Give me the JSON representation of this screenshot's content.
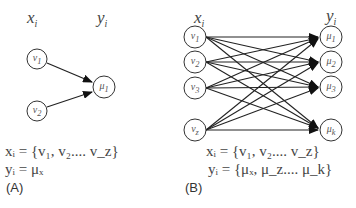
{
  "panelA": {
    "input_label": "x",
    "input_sub": "i",
    "output_label": "y",
    "output_sub": "i",
    "inputs": [
      {
        "name": "v",
        "sub": "1"
      },
      {
        "name": "v",
        "sub": "2"
      }
    ],
    "outputs": [
      {
        "name": "μ",
        "sub": "1"
      }
    ],
    "eq1": "xᵢ = {v₁, v₂.... v_z}",
    "eq2": "yᵢ = μₓ",
    "panel_label": "(A)"
  },
  "panelB": {
    "input_label": "x",
    "input_sub": "i",
    "output_label": "y",
    "output_sub": "i",
    "inputs": [
      {
        "name": "v",
        "sub": "1"
      },
      {
        "name": "v",
        "sub": "2"
      },
      {
        "name": "v",
        "sub": "3"
      },
      {
        "name": "v",
        "sub": "z"
      }
    ],
    "outputs": [
      {
        "name": "μ",
        "sub": "1"
      },
      {
        "name": "μ",
        "sub": "2"
      },
      {
        "name": "μ",
        "sub": "3"
      },
      {
        "name": "μ",
        "sub": "k"
      }
    ],
    "eq1": "xᵢ = {v₁, v₂.... v_z}",
    "eq2": "yᵢ = {μₓ, μ_z.... μ_k}",
    "panel_label": "(B)"
  },
  "colors": {
    "stroke": "#222222",
    "text": "#444444"
  }
}
